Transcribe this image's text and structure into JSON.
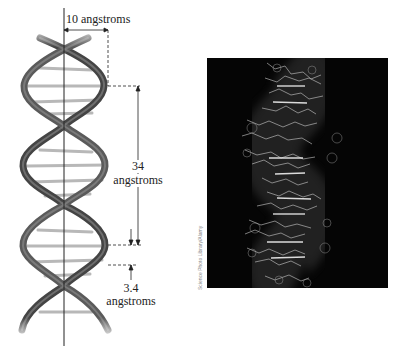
{
  "figure": {
    "left_panel": {
      "title": "DNA double helix model",
      "labels": {
        "width": "10 angstroms",
        "pitch_value": "34",
        "pitch_unit": "angstroms",
        "rise_value": "3.4",
        "rise_unit": "angstroms"
      }
    },
    "right_panel": {
      "title": "Computer model of DNA",
      "credit": "Science Photo Library/Alamy"
    }
  },
  "colors": {
    "strand": "#4a4a4a",
    "rung": "#b5b5b5",
    "annotation": "#222222",
    "photo_bg": "#050505",
    "photo_structure": "#d8d8d8"
  }
}
